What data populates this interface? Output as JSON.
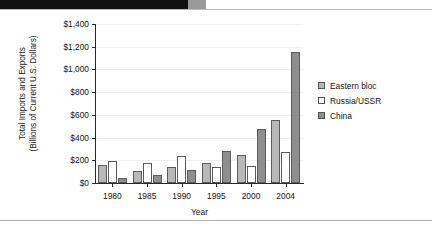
{
  "chart_data": {
    "type": "bar",
    "title": "",
    "subtitle": "",
    "xlabel": "Year",
    "ylabel": "Total Imports and Exports (Billions of Current U.S. Dollars)",
    "ylabel_line1": "Total Imports and Exports",
    "ylabel_line2": "(Billions of Current U.S. Dollars)",
    "categories": [
      "1980",
      "1985",
      "1990",
      "1995",
      "2000",
      "2004"
    ],
    "series": [
      {
        "name": "Eastern bloc",
        "color": "#b8b8b8",
        "values": [
          160,
          110,
          145,
          180,
          250,
          555
        ]
      },
      {
        "name": "Russia/USSR",
        "color": "#ffffff",
        "values": [
          190,
          175,
          235,
          145,
          150,
          270
        ]
      },
      {
        "name": "China",
        "color": "#8e8e8e",
        "values": [
          40,
          70,
          115,
          280,
          475,
          1155
        ]
      }
    ],
    "ylim": [
      0,
      1400
    ],
    "ytick_values": [
      0,
      200,
      400,
      600,
      800,
      1000,
      1200,
      1400
    ],
    "ytick_labels": [
      "$0",
      "$200",
      "$400",
      "$600",
      "$800",
      "$1,000",
      "$1,200",
      "$1,400"
    ],
    "grid": true,
    "legend_position": "right",
    "axis_color": "#2a2a2a",
    "bar_border_color": "#5c5c5c"
  },
  "legend": {
    "items": [
      {
        "label": "Eastern bloc",
        "swatch": "light-gray-swatch"
      },
      {
        "label": "Russia/USSR",
        "swatch": "white-swatch"
      },
      {
        "label": "China",
        "swatch": "dark-gray-swatch"
      }
    ]
  }
}
